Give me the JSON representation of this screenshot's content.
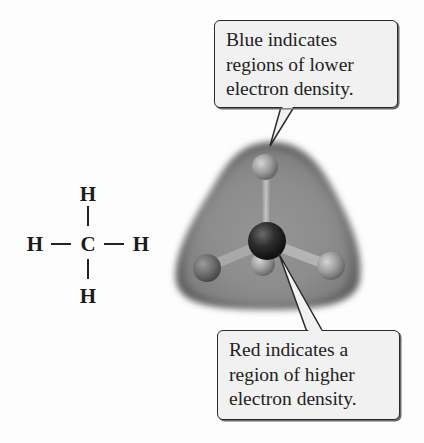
{
  "figure": {
    "lewis_structure": {
      "atoms": {
        "top": "H",
        "left": "H",
        "center": "C",
        "right": "H",
        "bottom": "H"
      },
      "bond_symbol": "—"
    },
    "molecule_model": {
      "description": "ball-and-stick CH4 inside electrostatic potential surface",
      "surface_color": "#7f7f7f",
      "carbon_color": "#2a2a2a",
      "hydrogen_color": "#9a9a9a"
    },
    "callouts": [
      {
        "id": "blue",
        "lines": [
          "Blue indicates",
          "regions of lower",
          "electron density."
        ]
      },
      {
        "id": "red",
        "lines": [
          "Red indicates a",
          "region of higher",
          "electron density."
        ]
      }
    ]
  }
}
